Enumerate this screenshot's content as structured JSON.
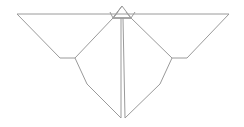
{
  "figure": {
    "stroke_color": "#9a9a9a",
    "background": "#ffffff",
    "stroke_width": 1
  },
  "shapes": {
    "top_edge": [
      [
        17,
        14
      ],
      [
        229,
        14
      ]
    ],
    "left_wing_outer": [
      [
        17,
        14
      ],
      [
        60,
        58
      ],
      [
        75,
        58
      ]
    ],
    "right_wing_outer": [
      [
        229,
        14
      ],
      [
        187,
        58
      ],
      [
        172,
        58
      ]
    ],
    "left_body_edge": [
      [
        113,
        18
      ],
      [
        75,
        58
      ],
      [
        87,
        84
      ],
      [
        121,
        118
      ]
    ],
    "right_body_edge": [
      [
        131,
        18
      ],
      [
        172,
        58
      ],
      [
        160,
        84
      ],
      [
        125,
        118
      ]
    ],
    "center_left": [
      [
        121,
        18
      ],
      [
        121,
        118
      ]
    ],
    "center_right": [
      [
        123,
        18
      ],
      [
        125,
        118
      ]
    ],
    "head_triangle": [
      [
        122,
        6
      ],
      [
        113,
        18
      ],
      [
        131,
        18
      ]
    ],
    "left_flap": [
      [
        110,
        12
      ],
      [
        113,
        18
      ],
      [
        118,
        12
      ]
    ],
    "right_flap": [
      [
        126,
        12
      ],
      [
        131,
        18
      ],
      [
        135,
        12
      ]
    ],
    "head_base": [
      [
        113,
        18
      ],
      [
        131,
        18
      ]
    ]
  }
}
